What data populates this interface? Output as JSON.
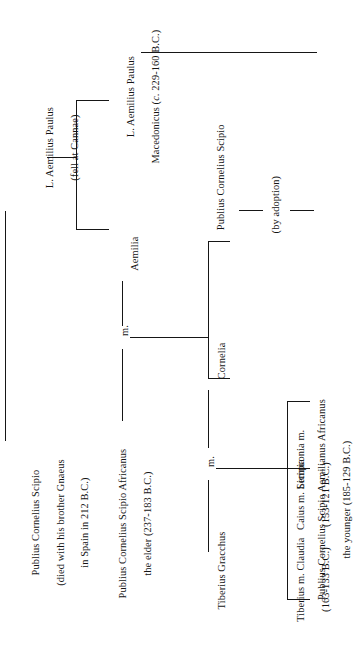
{
  "document": {
    "type": "genealogical-family-tree",
    "subject": "The Scipios and the Gracchi",
    "orientation": "rotated-90-ccw",
    "ink_color": "#161616",
    "background_color": "#ffffff"
  },
  "nodes": {
    "paulus_elder": {
      "line1": "L. Aemilius Paulus",
      "line2": "(fell at Cannae)"
    },
    "scipio_elder_gen1": {
      "line1": "Publius Cornelius Scipio",
      "line2": "(died with his brother Gnaeus",
      "line3": "in Spain in 212 B.C.)"
    },
    "paulus_macedonicus": {
      "line1": "L. Aemilius Paulus",
      "line2_pre": "Macedonicus (",
      "line2_italic": "c.",
      "line2_post": " 229-160 B.C.)"
    },
    "aemilia": {
      "name": "Aemilia"
    },
    "africanus_elder": {
      "line1": "Publius Cornelius Scipio Africanus",
      "line2": "the elder (237-183 B.C.)"
    },
    "marriage_1": {
      "label": "m."
    },
    "publius_cornelius_scipio": {
      "name": "Publius Cornelius Scipio"
    },
    "adoption": {
      "label": "(by adoption)"
    },
    "aemilianus_younger": {
      "line1": "Publius Cornelius Scipio Aemilianus Africanus",
      "line2": "the younger (185-129 B.C.)"
    },
    "cornelia": {
      "name": "Cornelia"
    },
    "tiberius_gracchus": {
      "name": "Tiberius Gracchus"
    },
    "marriage_2": {
      "label": "m."
    },
    "sempronia": {
      "name": "Sempronia m."
    },
    "caius_gracchus": {
      "line1": "Caius m. Licinia",
      "line2": "(153-121 B.C.)"
    },
    "tiberius_gracchus_son": {
      "line1": "Tiberius m. Claudia",
      "line2": "(163-133 B.C.)"
    }
  }
}
